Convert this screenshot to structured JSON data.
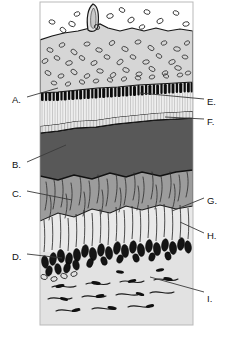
{
  "figure": {
    "type": "labeled-histology-diagram",
    "frame": {
      "x": 40,
      "y": 2,
      "width": 153,
      "height": 323
    },
    "background_color": "#ffffff"
  },
  "labels": [
    {
      "id": "A",
      "text": "A.",
      "x": 12,
      "y": 95,
      "leader": {
        "x1": 27,
        "y1": 97,
        "x2": 58,
        "y2": 88
      },
      "points_to": "dark-pigment-band-left"
    },
    {
      "id": "B",
      "text": "B.",
      "x": 12,
      "y": 160,
      "leader": {
        "x1": 27,
        "y1": 162,
        "x2": 66,
        "y2": 145
      },
      "points_to": "dark-gray-band"
    },
    {
      "id": "C",
      "text": "C.",
      "x": 12,
      "y": 189,
      "leader": {
        "x1": 27,
        "y1": 191,
        "x2": 72,
        "y2": 200
      },
      "points_to": "mid-gray-fiber-layer"
    },
    {
      "id": "D",
      "text": "D.",
      "x": 12,
      "y": 252,
      "leader": {
        "x1": 27,
        "y1": 254,
        "x2": 62,
        "y2": 258
      },
      "points_to": "nuclei-row-left"
    },
    {
      "id": "E",
      "text": "E.",
      "x": 207,
      "y": 97,
      "leader": {
        "x1": 204,
        "y1": 99,
        "x2": 140,
        "y2": 93
      },
      "points_to": "dark-pigment-band-right"
    },
    {
      "id": "F",
      "text": "F.",
      "x": 207,
      "y": 117,
      "leader": {
        "x1": 204,
        "y1": 119,
        "x2": 165,
        "y2": 117
      },
      "points_to": "thin-striated-membrane"
    },
    {
      "id": "G",
      "text": "G.",
      "x": 207,
      "y": 196,
      "leader": {
        "x1": 204,
        "y1": 198,
        "x2": 172,
        "y2": 211
      },
      "points_to": "pale-columnar-zone"
    },
    {
      "id": "H",
      "text": "H.",
      "x": 207,
      "y": 231,
      "leader": {
        "x1": 204,
        "y1": 233,
        "x2": 180,
        "y2": 222
      },
      "points_to": "outer-column-edge"
    },
    {
      "id": "I",
      "text": "I.",
      "x": 207,
      "y": 294,
      "leader": {
        "x1": 204,
        "y1": 292,
        "x2": 150,
        "y2": 277
      },
      "points_to": "loose-fiber-basal-layer"
    }
  ],
  "layers": [
    {
      "name": "free-cells-top",
      "color": "#ffffff",
      "top": 2,
      "bottom": 36
    },
    {
      "name": "granular-pale-layer",
      "color": "#d4d4d4",
      "top": 36,
      "bottom": 88
    },
    {
      "name": "dark-pigment-band",
      "color": "#111111",
      "top": 88,
      "bottom": 100
    },
    {
      "name": "striated-pale-layer",
      "color": "#ececec",
      "top": 100,
      "bottom": 122
    },
    {
      "name": "thin-membrane",
      "color": "#bdbdbd",
      "top": 122,
      "bottom": 128
    },
    {
      "name": "dark-gray-band",
      "color": "#575757",
      "top": 128,
      "bottom": 178
    },
    {
      "name": "mid-gray-fiber-layer",
      "color": "#9a9a9a",
      "top": 178,
      "bottom": 232
    },
    {
      "name": "pale-columnar-zone",
      "color": "#e3e3e3",
      "top": 214,
      "bottom": 262
    },
    {
      "name": "nuclei-row",
      "color": "#1a1a1a",
      "top": 236,
      "bottom": 272
    },
    {
      "name": "loose-fiber-basal",
      "color": "#e0e0e0",
      "top": 262,
      "bottom": 325
    }
  ],
  "colors": {
    "ink": "#111111",
    "leader_line": "#3a3a3a",
    "frame_edge": "#9f9f9f"
  }
}
